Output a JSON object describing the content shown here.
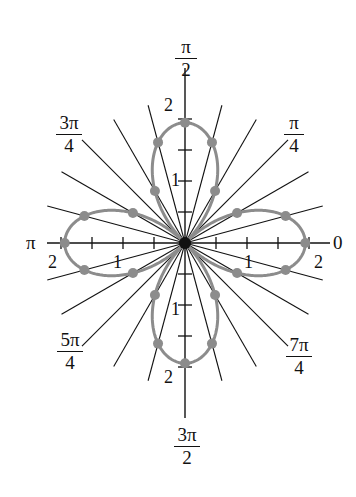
{
  "chart_data": {
    "type": "line",
    "subtype": "polar",
    "title": "",
    "equation_implied": "r = 2cos(2θ) (four-leaved rose)",
    "series": [
      {
        "name": "rose curve",
        "color": "#8c8c8c",
        "function": "r = 2cos(2θ)",
        "points_theta_deg": [
          0,
          15,
          30,
          60,
          75,
          90,
          105,
          120,
          150,
          165,
          180,
          195,
          210,
          240,
          255,
          270,
          285,
          300,
          330,
          345
        ],
        "points_r": [
          2,
          1.73,
          1,
          1,
          1.73,
          2,
          1.73,
          1,
          1,
          1.73,
          2,
          1.73,
          1,
          1,
          1.73,
          2,
          1.73,
          1,
          1,
          1.73
        ]
      }
    ],
    "angle_labels": [
      {
        "angle": "0",
        "num": "0",
        "den": ""
      },
      {
        "angle": "π/4",
        "num": "π",
        "den": "4"
      },
      {
        "angle": "π/2",
        "num": "π",
        "den": "2"
      },
      {
        "angle": "3π/4",
        "num": "3π",
        "den": "4"
      },
      {
        "angle": "π",
        "num": "π",
        "den": ""
      },
      {
        "angle": "5π/4",
        "num": "5π",
        "den": "4"
      },
      {
        "angle": "3π/2",
        "num": "3π",
        "den": "2"
      },
      {
        "angle": "7π/4",
        "num": "7π",
        "den": "4"
      }
    ],
    "radial_ticks": [
      0.5,
      1,
      1.5,
      2
    ],
    "radial_tick_labels": [
      "1",
      "2"
    ],
    "rlim": [
      0,
      2.3
    ],
    "rays_every_deg": 15,
    "grid": "radial lines every π/12"
  },
  "labels": {
    "zero": "0",
    "pi": "π",
    "pi_over_2": {
      "num": "π",
      "den": "2"
    },
    "pi_over_4": {
      "num": "π",
      "den": "4"
    },
    "three_pi_over_4": {
      "num": "3π",
      "den": "4"
    },
    "five_pi_over_4": {
      "num": "5π",
      "den": "4"
    },
    "three_pi_over_2": {
      "num": "3π",
      "den": "2"
    },
    "seven_pi_over_4": {
      "num": "7π",
      "den": "4"
    },
    "tick_1": "1",
    "tick_2": "2"
  },
  "colors": {
    "axis": "#111111",
    "curve": "#8c8c8c",
    "dots": "#8c8c8c"
  }
}
